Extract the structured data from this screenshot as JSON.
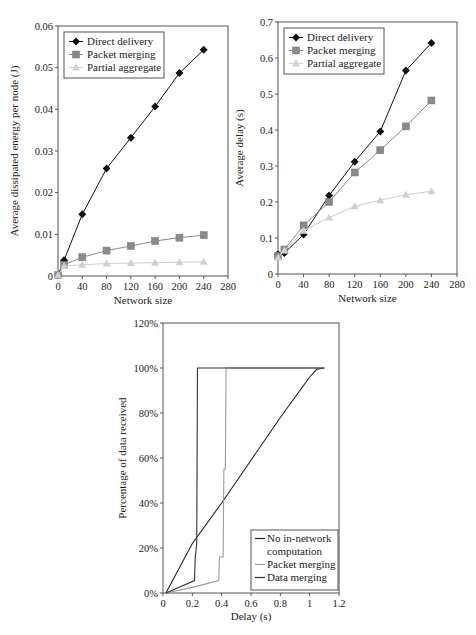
{
  "chart_data": [
    {
      "id": "energy",
      "type": "line",
      "title": "",
      "xlabel": "Network size",
      "ylabel": "Average dissipated  energy per node (J)",
      "xlim": [
        0,
        280
      ],
      "ylim": [
        0,
        0.06
      ],
      "xticks": [
        0,
        40,
        80,
        120,
        160,
        200,
        240,
        280
      ],
      "yticks": [
        0,
        0.01,
        0.02,
        0.03,
        0.04,
        0.05,
        0.06
      ],
      "ytick_labels": [
        "0",
        "0.01",
        "0.02",
        "0.03",
        "0.04",
        "0.05",
        "0.06"
      ],
      "grid": false,
      "legend_position": "upper-left",
      "x": [
        0,
        10,
        40,
        80,
        120,
        160,
        200,
        240
      ],
      "series": [
        {
          "name": "Direct delivery",
          "marker": "diamond",
          "color": "#111111",
          "values": [
            0.0002,
            0.0038,
            0.0148,
            0.0258,
            0.0332,
            0.0407,
            0.0487,
            0.0543
          ]
        },
        {
          "name": "Packet merging",
          "marker": "square",
          "color": "#8a8a8a",
          "values": [
            0.0002,
            0.0027,
            0.0045,
            0.0061,
            0.0072,
            0.0084,
            0.0092,
            0.0098
          ]
        },
        {
          "name": "Partial aggregate",
          "marker": "triangle",
          "color": "#cfcfcf",
          "values": [
            0.0002,
            0.0024,
            0.0027,
            0.003,
            0.0031,
            0.0032,
            0.0033,
            0.0034
          ]
        }
      ]
    },
    {
      "id": "delay",
      "type": "line",
      "title": "",
      "xlabel": "Network size",
      "ylabel": "Average delay (s)",
      "xlim": [
        0,
        280
      ],
      "ylim": [
        0,
        0.7
      ],
      "xticks": [
        0,
        40,
        80,
        120,
        160,
        200,
        240,
        280
      ],
      "yticks": [
        0,
        0.1,
        0.2,
        0.3,
        0.4,
        0.5,
        0.6,
        0.7
      ],
      "ytick_labels": [
        "0",
        "0.1",
        "0.2",
        "0.3",
        "0.4",
        "0.5",
        "0.6",
        "0.7"
      ],
      "grid": false,
      "legend_position": "upper-left",
      "x": [
        0,
        10,
        40,
        80,
        120,
        160,
        200,
        240
      ],
      "series": [
        {
          "name": "Direct delivery",
          "marker": "diamond",
          "color": "#111111",
          "values": [
            0.055,
            0.058,
            0.11,
            0.218,
            0.312,
            0.396,
            0.565,
            0.642
          ]
        },
        {
          "name": "Packet merging",
          "marker": "square",
          "color": "#8a8a8a",
          "values": [
            0.05,
            0.068,
            0.135,
            0.2,
            0.282,
            0.344,
            0.41,
            0.482
          ]
        },
        {
          "name": "Partial aggregate",
          "marker": "triangle",
          "color": "#cfcfcf",
          "values": [
            0.045,
            0.065,
            0.12,
            0.157,
            0.188,
            0.205,
            0.22,
            0.23
          ]
        }
      ]
    },
    {
      "id": "cdf",
      "type": "line",
      "title": "",
      "xlabel": "Delay (s)",
      "ylabel": "Percentage of data received",
      "xlim": [
        0,
        1.2
      ],
      "ylim": [
        0,
        120
      ],
      "xticks": [
        0,
        0.2,
        0.4,
        0.6,
        0.8,
        1,
        1.2
      ],
      "xtick_labels": [
        "0",
        "0.2",
        "0.4",
        "0.6",
        "0.8",
        "1",
        "1.2"
      ],
      "yticks": [
        0,
        20,
        40,
        60,
        80,
        100,
        120
      ],
      "ytick_labels": [
        "0%",
        "20%",
        "40%",
        "60%",
        "80%",
        "100%",
        "120%"
      ],
      "grid": false,
      "legend_position": "lower-right",
      "series": [
        {
          "name": "No in-network computation",
          "color": "#222222",
          "points": [
            [
              0.02,
              0
            ],
            [
              0.2,
              22
            ],
            [
              0.4,
              40
            ],
            [
              0.6,
              59
            ],
            [
              0.8,
              78
            ],
            [
              1.0,
              96
            ],
            [
              1.05,
              99.5
            ],
            [
              1.1,
              100
            ]
          ]
        },
        {
          "name": "Packet merging",
          "color": "#9a9a9a",
          "points": [
            [
              0.02,
              0
            ],
            [
              0.2,
              2.5
            ],
            [
              0.38,
              5.5
            ],
            [
              0.385,
              16
            ],
            [
              0.41,
              16
            ],
            [
              0.415,
              55
            ],
            [
              0.425,
              55
            ],
            [
              0.43,
              100
            ],
            [
              1.1,
              100
            ]
          ]
        },
        {
          "name": "Data merging",
          "color": "#333333",
          "points": [
            [
              0.02,
              0
            ],
            [
              0.215,
              5.5
            ],
            [
              0.22,
              16
            ],
            [
              0.23,
              22
            ],
            [
              0.235,
              100
            ],
            [
              1.1,
              100
            ]
          ]
        }
      ]
    }
  ],
  "legend_labels": {
    "energy": [
      "Direct delivery",
      "Packet merging",
      "Partial aggregate"
    ],
    "delay": [
      "Direct delivery",
      "Packet merging",
      "Partial aggregate"
    ],
    "cdf": [
      "No in-network",
      "computation",
      "Packet merging",
      "Data merging"
    ]
  }
}
